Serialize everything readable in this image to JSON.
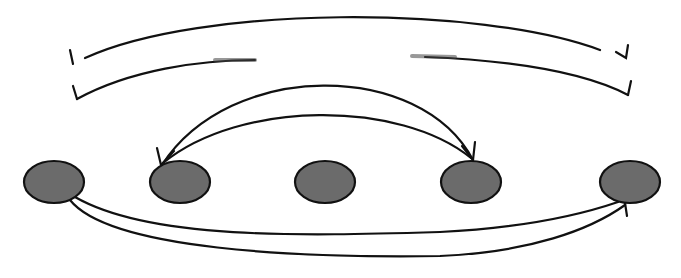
{
  "diagram": {
    "type": "arc-diagram",
    "colors": {
      "node_fill": "#6b6b6b",
      "node_stroke": "#111111",
      "edge": "#111111",
      "background": "#ffffff"
    },
    "nodes": [
      {
        "id": "n1",
        "cx": 55,
        "cy": 182
      },
      {
        "id": "n2",
        "cx": 180,
        "cy": 182
      },
      {
        "id": "n3",
        "cx": 325,
        "cy": 182
      },
      {
        "id": "n4",
        "cx": 470,
        "cy": 182
      },
      {
        "id": "n5",
        "cx": 630,
        "cy": 182
      }
    ],
    "edges": [
      {
        "id": "top-outer",
        "from": "left-bracket",
        "to": "right-bracket",
        "direction": "open-brackets"
      },
      {
        "id": "top-inner",
        "from": "left-bracket",
        "to": "right-bracket",
        "direction": "open-brackets"
      },
      {
        "id": "mid-outer",
        "from": "n2",
        "to": "n4",
        "arrow": "n4"
      },
      {
        "id": "mid-inner",
        "from": "n4",
        "to": "n2",
        "arrow": "n2"
      },
      {
        "id": "bottom-inner",
        "from": "n1",
        "to": "n5",
        "arrow": "n5"
      },
      {
        "id": "bottom-outer",
        "from": "n1",
        "to": "n5",
        "arrow": "n5"
      }
    ]
  }
}
